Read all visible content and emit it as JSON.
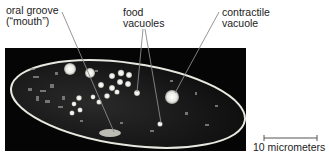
{
  "labels": {
    "oral_groove": "oral groove\n(“mouth”)",
    "food_vacuoles": "food\nvacuoles",
    "contractile_vacuole": "contractile\nvacuole"
  },
  "scale_bar": {
    "text": "10 micrometers"
  },
  "colors": {
    "background": "#ffffff",
    "micrograph": "#050505",
    "cell_outline": "#e8e8e0",
    "leader_line": "#8a8a8a",
    "text": "#222222"
  }
}
